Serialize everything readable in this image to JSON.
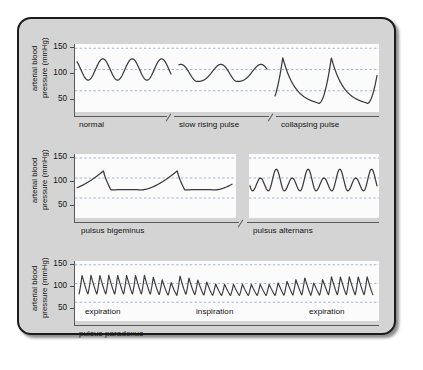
{
  "figure": {
    "y_axis_label": "arterial blood\npressure (mmHg)",
    "y_ticks": [
      "150",
      "100",
      "50"
    ],
    "colors": {
      "frame_bg": "#d4d4d4",
      "frame_border": "#1c1c1c",
      "plot_bg": "#fbfbfb",
      "gridline": "#8ea6c8",
      "trace": "#3a3a3a",
      "axis": "#5a5a5a"
    }
  },
  "chart_data": {
    "type": "line",
    "title": "",
    "xlabel": "",
    "ylabel": "arterial blood pressure (mmHg)",
    "ylim": [
      0,
      160
    ],
    "yticks": [
      50,
      100,
      150
    ],
    "grid": true,
    "legend": "none",
    "panels": [
      {
        "name": "panel-1",
        "caption": "",
        "segments": [
          {
            "label": "normal",
            "waveform": "normal",
            "systolic": 125,
            "diastolic": 75,
            "beats": 3.2,
            "description": "smooth rounded sinusoidal pulses, equal amplitude"
          },
          {
            "label": "slow rising pulse",
            "waveform": "slow-rising",
            "systolic": 112,
            "diastolic": 72,
            "beats": 2.2,
            "description": "low amplitude, slow upstroke and rounded delayed peak (anacrotic)"
          },
          {
            "label": "collapsing pulse",
            "waveform": "collapsing",
            "systolic": 128,
            "diastolic": 20,
            "beats": 2.1,
            "description": "rapid steep upstroke to sharp peak then rapid collapse, wide pulse pressure"
          }
        ]
      },
      {
        "name": "panel-2",
        "caption": "",
        "segments": [
          {
            "label": "pulsus bigeminus",
            "waveform": "bigeminus",
            "systolic": 118,
            "diastolic": 70,
            "beats": 2.1,
            "description": "gradual rise to peak followed by abrupt fall to a low flat plateau, paired beats"
          },
          {
            "label": "pulsus alternans",
            "waveform": "alternans",
            "systolic": 122,
            "diastolic": 68,
            "secondary_systolic": 100,
            "beats": 4.0,
            "description": "alternating strong and weak beats of regular rhythm"
          }
        ]
      },
      {
        "name": "panel-3",
        "caption": "pulsus paradoxus",
        "segments": [
          {
            "label": "expiration",
            "waveform": "paradoxus-expiration",
            "systolic": 122,
            "diastolic": 72,
            "beats": 11,
            "description": "high amplitude beats during expiration"
          },
          {
            "label": "inspiration",
            "waveform": "paradoxus-inspiration",
            "systolic": 98,
            "diastolic": 68,
            "beats": 15,
            "description": "amplitude and systolic pressure fall markedly during inspiration"
          },
          {
            "label": "expiration",
            "waveform": "paradoxus-expiration2",
            "systolic": 118,
            "diastolic": 70,
            "beats": 7,
            "description": "amplitude recovers during expiration"
          }
        ]
      }
    ]
  }
}
